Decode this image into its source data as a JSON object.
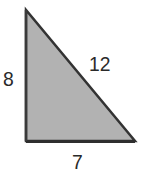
{
  "diagram": {
    "type": "right-triangle",
    "fill_color": "#b2b2b2",
    "stroke_color": "#333333",
    "vertices": {
      "top": [
        26,
        10
      ],
      "bottom_left": [
        26,
        141
      ],
      "bottom_right": [
        135,
        141
      ]
    },
    "labels": {
      "left_side": "8",
      "hypotenuse": "12",
      "bottom_side": "7"
    }
  }
}
